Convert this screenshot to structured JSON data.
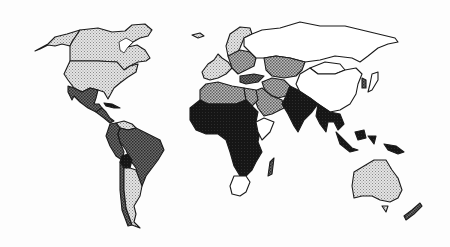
{
  "map": {
    "title": "",
    "type": "choropleth-world",
    "classes": [
      {
        "id": "c0",
        "label": "",
        "color": "#ffffff",
        "pattern": "none"
      },
      {
        "id": "c1",
        "label": "",
        "color": "#c9c9c9",
        "pattern": "light-dots"
      },
      {
        "id": "c2",
        "label": "",
        "color": "#8c8c8c",
        "pattern": "medium-dots"
      },
      {
        "id": "c3",
        "label": "",
        "color": "#4a4a4a",
        "pattern": "dark-dots"
      },
      {
        "id": "c4",
        "label": "",
        "color": "#111111",
        "pattern": "solid"
      }
    ],
    "regions": [
      {
        "name": "Alaska",
        "class": "c1"
      },
      {
        "name": "Canada",
        "class": "c1"
      },
      {
        "name": "United States",
        "class": "c1"
      },
      {
        "name": "Greenland",
        "class": "c0"
      },
      {
        "name": "Mexico",
        "class": "c3"
      },
      {
        "name": "Central America",
        "class": "c3"
      },
      {
        "name": "Caribbean",
        "class": "c4"
      },
      {
        "name": "Venezuela",
        "class": "c1"
      },
      {
        "name": "Colombia",
        "class": "c3"
      },
      {
        "name": "Peru",
        "class": "c3"
      },
      {
        "name": "Brazil",
        "class": "c3"
      },
      {
        "name": "Bolivia",
        "class": "c4"
      },
      {
        "name": "Paraguay",
        "class": "c3"
      },
      {
        "name": "Chile",
        "class": "c3"
      },
      {
        "name": "Argentina",
        "class": "c1"
      },
      {
        "name": "Iceland",
        "class": "c1"
      },
      {
        "name": "Western Europe",
        "class": "c1"
      },
      {
        "name": "Scandinavia",
        "class": "c1"
      },
      {
        "name": "Eastern Europe",
        "class": "c2"
      },
      {
        "name": "Russia",
        "class": "c0"
      },
      {
        "name": "Kazakhstan",
        "class": "c2"
      },
      {
        "name": "Mongolia",
        "class": "c0"
      },
      {
        "name": "China",
        "class": "c0"
      },
      {
        "name": "Japan",
        "class": "c0"
      },
      {
        "name": "Korea",
        "class": "c3"
      },
      {
        "name": "Turkey",
        "class": "c3"
      },
      {
        "name": "Iran",
        "class": "c2"
      },
      {
        "name": "Saudi Arabia",
        "class": "c2"
      },
      {
        "name": "North Africa",
        "class": "c2"
      },
      {
        "name": "Egypt",
        "class": "c2"
      },
      {
        "name": "Sahel",
        "class": "c4"
      },
      {
        "name": "West Africa",
        "class": "c4"
      },
      {
        "name": "Central Africa",
        "class": "c4"
      },
      {
        "name": "East Africa",
        "class": "c4"
      },
      {
        "name": "Horn of Africa",
        "class": "c0"
      },
      {
        "name": "Southern Africa",
        "class": "c4"
      },
      {
        "name": "South Africa",
        "class": "c0"
      },
      {
        "name": "Madagascar",
        "class": "c3"
      },
      {
        "name": "India",
        "class": "c4"
      },
      {
        "name": "Southeast Asia",
        "class": "c4"
      },
      {
        "name": "Indonesia",
        "class": "c4"
      },
      {
        "name": "Papua New Guinea",
        "class": "c4"
      },
      {
        "name": "Australia",
        "class": "c1"
      },
      {
        "name": "New Zealand",
        "class": "c3"
      }
    ]
  }
}
